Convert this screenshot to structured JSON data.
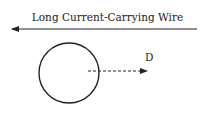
{
  "diagram": {
    "wire_label": "Long Current-Carrying Wire",
    "distance_label": "D",
    "colors": {
      "stroke": "#222222",
      "background": "#ffffff"
    },
    "elements": {
      "wire": {
        "x1": 197,
        "x2": 13,
        "y": 29,
        "direction": "left"
      },
      "loop": {
        "cx": 69,
        "cy": 73,
        "r": 30
      },
      "distance_arrow": {
        "x1": 88,
        "x2": 147,
        "y": 71,
        "style": "dashed"
      }
    }
  }
}
